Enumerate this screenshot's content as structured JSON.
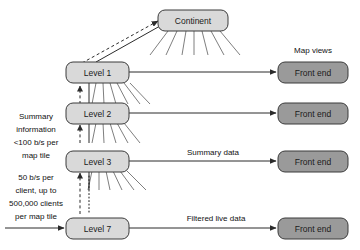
{
  "diagram": {
    "type": "hierarchical-dataflow",
    "nodes": {
      "continent": {
        "label": "Continent",
        "style": "light"
      },
      "level1": {
        "label": "Level 1",
        "style": "light"
      },
      "level2": {
        "label": "Level 2",
        "style": "light"
      },
      "level3": {
        "label": "Level 3",
        "style": "light"
      },
      "level7": {
        "label": "Level 7",
        "style": "light"
      },
      "frontend1": {
        "label": "Front end",
        "style": "dark"
      },
      "frontend2": {
        "label": "Front end",
        "style": "dark"
      },
      "frontend3": {
        "label": "Front end",
        "style": "dark"
      },
      "frontend4": {
        "label": "Front end",
        "style": "dark"
      }
    },
    "labels": {
      "map_views": "Map views",
      "summary_data": "Summary data",
      "filtered_live_data": "Filtered live data",
      "summary_info_line1": "Summary",
      "summary_info_line2": "information",
      "summary_info_line3": "<100 b/s per",
      "summary_info_line4": "map tile",
      "client_rate_line1": "50 b/s per",
      "client_rate_line2": "client, up to",
      "client_rate_line3": "500,000 clients",
      "client_rate_line4": "per map tile"
    },
    "colors": {
      "box_light_fill": "#d9d9d9",
      "box_dark_fill": "#9a9a9a",
      "stroke": "#3b3b3b",
      "line": "#2b2b2b",
      "fan": "#6f6f6f",
      "background": "#ffffff"
    }
  }
}
